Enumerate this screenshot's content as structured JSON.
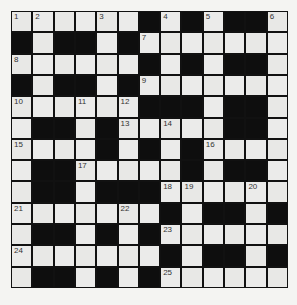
{
  "puzzle": {
    "type": "crossword",
    "rows": 13,
    "cols": 13,
    "colors": {
      "block": "#0e0e0e",
      "cell": "#ebebea",
      "background": "#f4f4f2",
      "number_text": "#333333"
    },
    "layout": [
      "WWWWWWBWBWBBW",
      "BWBBWBWWWWWWW",
      "WWWWWWBWBWBBW",
      "BWBBWBWWWWWWW",
      "WWWWWWBBBWBBW",
      "WBBWBWWWWWBBW",
      "WWWWBWBWBWWWW",
      "WBBWWWWWBWBBW",
      "WBBWBBBWWWWWW",
      "WWWWWWWBWBBWB",
      "WBBWBWBWWWWWW",
      "WWWWWWWBWBBWB",
      "WBBWBWBWWWWWW"
    ],
    "numbers": [
      {
        "row": 0,
        "col": 0,
        "n": "1"
      },
      {
        "row": 0,
        "col": 1,
        "n": "2"
      },
      {
        "row": 0,
        "col": 4,
        "n": "3"
      },
      {
        "row": 0,
        "col": 7,
        "n": "4"
      },
      {
        "row": 0,
        "col": 9,
        "n": "5"
      },
      {
        "row": 0,
        "col": 12,
        "n": "6"
      },
      {
        "row": 1,
        "col": 6,
        "n": "7"
      },
      {
        "row": 2,
        "col": 0,
        "n": "8"
      },
      {
        "row": 3,
        "col": 6,
        "n": "9"
      },
      {
        "row": 4,
        "col": 0,
        "n": "10"
      },
      {
        "row": 4,
        "col": 3,
        "n": "11"
      },
      {
        "row": 4,
        "col": 5,
        "n": "12"
      },
      {
        "row": 5,
        "col": 5,
        "n": "13"
      },
      {
        "row": 5,
        "col": 7,
        "n": "14"
      },
      {
        "row": 6,
        "col": 0,
        "n": "15"
      },
      {
        "row": 6,
        "col": 9,
        "n": "16"
      },
      {
        "row": 7,
        "col": 3,
        "n": "17"
      },
      {
        "row": 8,
        "col": 7,
        "n": "18"
      },
      {
        "row": 8,
        "col": 8,
        "n": "19"
      },
      {
        "row": 8,
        "col": 11,
        "n": "20"
      },
      {
        "row": 9,
        "col": 0,
        "n": "21"
      },
      {
        "row": 9,
        "col": 5,
        "n": "22"
      },
      {
        "row": 10,
        "col": 7,
        "n": "23"
      },
      {
        "row": 11,
        "col": 0,
        "n": "24"
      },
      {
        "row": 12,
        "col": 7,
        "n": "25"
      }
    ]
  }
}
